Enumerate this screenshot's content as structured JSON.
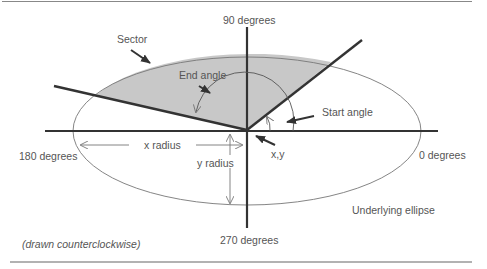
{
  "diagram": {
    "labels": {
      "deg90": "90 degrees",
      "deg180": "180 degrees",
      "deg0": "0 degrees",
      "deg270": "270 degrees",
      "sector": "Sector",
      "end_angle": "End angle",
      "start_angle": "Start angle",
      "x_radius": "x radius",
      "y_radius": "y radius",
      "xy": "x,y",
      "underlying_ellipse": "Underlying ellipse",
      "note": "(drawn counterclockwise)"
    },
    "colors": {
      "sector_fill": "#c8c8c8",
      "axis": "#333333",
      "text": "#555555",
      "rule": "#555555"
    }
  }
}
